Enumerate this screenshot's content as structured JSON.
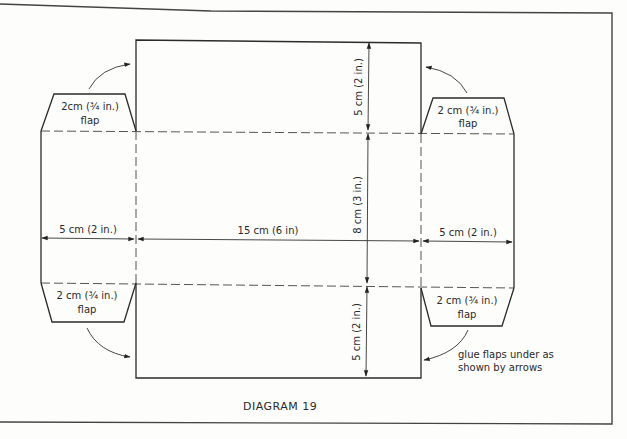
{
  "caption": "DIAGRAM 19",
  "flaps": {
    "top_left": {
      "line1": "2cm (¾ in.)",
      "line2": "flap"
    },
    "top_right": {
      "line1": "2 cm (¾ in.)",
      "line2": "flap"
    },
    "bottom_left": {
      "line1": "2 cm (¾ in.)",
      "line2": "flap"
    },
    "bottom_right": {
      "line1": "2 cm (¾ in.)",
      "line2": "flap"
    }
  },
  "dimensions": {
    "left_width": "5 cm (2 in.)",
    "center_width": "15 cm (6 in)",
    "right_width": "5 cm (2 in.)",
    "top_height": "5 cm (2 in.)",
    "middle_height": "8 cm (3 in.)",
    "bottom_height": "5 cm (2 in.)"
  },
  "note": {
    "line1": "glue flaps under as",
    "line2": "shown by arrows"
  },
  "colors": {
    "line": "#2b2b2b",
    "background": "#fdfdfc"
  }
}
